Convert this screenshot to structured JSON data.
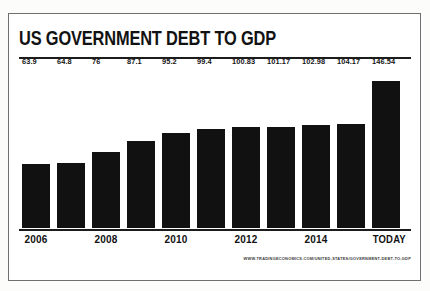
{
  "chart_data": {
    "type": "bar",
    "title": "US GOVERNMENT DEBT TO GDP",
    "xlabel": "",
    "ylabel": "",
    "ylim": [
      0,
      160
    ],
    "grid": false,
    "legend": "none",
    "categories": [
      "2006",
      "2007",
      "2008",
      "2009",
      "2010",
      "2011",
      "2012",
      "2013",
      "2014",
      "2015",
      "TODAY"
    ],
    "values": [
      63.9,
      64.8,
      76,
      87.1,
      95.2,
      99.4,
      100.83,
      101.17,
      102.98,
      104.17,
      146.54
    ],
    "value_labels": [
      "63.9",
      "64.8",
      "76",
      "87.1",
      "95.2",
      "99.4",
      "100.83",
      "101.17",
      "102.98",
      "104.17",
      "146.54"
    ],
    "tick_labels": [
      "2006",
      "",
      "2008",
      "",
      "2010",
      "",
      "2012",
      "",
      "2014",
      "",
      "TODAY"
    ],
    "bar_color": "#111111",
    "annotation": "WWW.TRADINGECONOMICS.COM/UNITED-STATES/GOVERNMENT-DEBT-TO-GDP"
  },
  "header": {
    "title": "US GOVERNMENT DEBT TO GDP"
  },
  "footer": {
    "source": "WWW.TRADINGECONOMICS.COM/UNITED-STATES/GOVERNMENT-DEBT-TO-GDP"
  }
}
